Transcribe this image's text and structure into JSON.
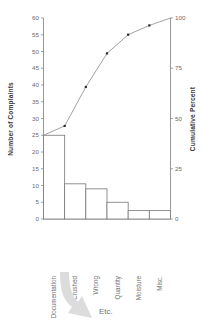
{
  "chart_data": {
    "type": "bar",
    "title": "",
    "categories": [
      "Documentation",
      "Crushed",
      "Wrong",
      "Quantity",
      "Moisture",
      "Misc."
    ],
    "values": [
      25,
      10.5,
      9,
      5,
      2.5,
      2.5
    ],
    "series": [
      {
        "name": "Number of Complaints",
        "values": [
          25,
          10.5,
          9,
          5,
          2.5,
          2.5
        ]
      },
      {
        "name": "Cumulative Percent",
        "values": [
          46.3,
          65.7,
          82.4,
          91.7,
          96.3,
          100
        ]
      }
    ],
    "xlabel": "",
    "ylabel": "Number of Complaints",
    "y2label": "Cumulative Percent",
    "ylim": [
      0,
      60
    ],
    "y2lim": [
      0,
      100
    ],
    "yticks": [
      0,
      5,
      10,
      15,
      20,
      25,
      30,
      35,
      40,
      45,
      50,
      55,
      60
    ],
    "y2ticks": [
      0,
      25,
      50,
      75,
      100
    ],
    "grid": false,
    "legend": "none"
  },
  "axes": {
    "left_title": "Number of Complaints",
    "right_title": "Cumulative Percent",
    "left_ticks": [
      "0",
      "5",
      "10",
      "15",
      "20",
      "25",
      "30",
      "35",
      "40",
      "45",
      "50",
      "55",
      "60"
    ],
    "right_ticks": [
      "0",
      "25",
      "50",
      "75",
      "100"
    ]
  },
  "categories": {
    "labels": [
      "Documentation",
      "Crushed",
      "Wrong",
      "Quantity",
      "Moisture",
      "Misc."
    ]
  },
  "annotation": {
    "etc_label": "Etc.",
    "arrow_name": "down-right-curved-arrow"
  },
  "colors": {
    "background": "#ffffff",
    "axis": "#8c8c8c",
    "bar_fill": "#ffffff",
    "bar_stroke": "#777777",
    "line": "#8a8a8a",
    "marker": "#2b2b2b",
    "arrow": "#dcdcdc",
    "text": "#6b6b6b"
  }
}
